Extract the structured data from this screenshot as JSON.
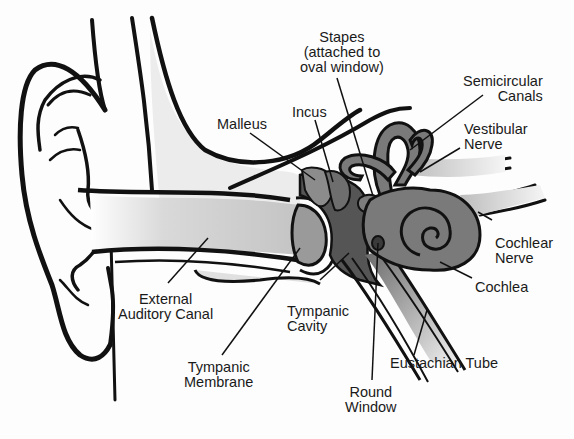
{
  "diagram": {
    "colors": {
      "outline": "#111111",
      "canal_fill": "#d2d2d2",
      "ossicle_fill": "#8a8a8a",
      "cavity_fill": "#5a5a5a",
      "inner_ear_fill": "#7a7a7a",
      "nerve_fill": "#c8c8c8",
      "label_text": "#1a1a1a",
      "background": "#fdfdfd"
    },
    "labels": {
      "stapes": {
        "line1": "Stapes",
        "line2": "(attached to",
        "line3": "oval window)"
      },
      "semicircular_canals": {
        "line1": "Semicircular",
        "line2": "Canals"
      },
      "incus": {
        "line1": "Incus"
      },
      "malleus": {
        "line1": "Malleus"
      },
      "vestibular_nerve": {
        "line1": "Vestibular",
        "line2": "Nerve"
      },
      "cochlear_nerve": {
        "line1": "Cochlear",
        "line2": "Nerve"
      },
      "cochlea": {
        "line1": "Cochlea"
      },
      "external_auditory_canal": {
        "line1": "External",
        "line2": "Auditory Canal"
      },
      "tympanic_cavity": {
        "line1": "Tympanic",
        "line2": "Cavity"
      },
      "tympanic_membrane": {
        "line1": "Tympanic",
        "line2": "Membrane"
      },
      "eustachian_tube": {
        "line1": "Eustachian Tube"
      },
      "round_window": {
        "line1": "Round",
        "line2": "Window"
      }
    }
  }
}
